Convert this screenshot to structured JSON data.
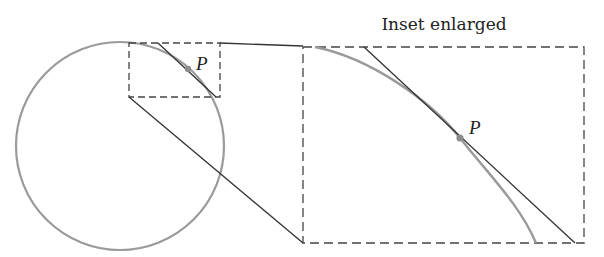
{
  "diagram": {
    "title": "Inset enlarged",
    "point_label_small": "P",
    "point_label_large": "P",
    "colors": {
      "curve": "#9a9a9a",
      "line": "#333333",
      "dash": "#444444",
      "point": "#8c8c8c"
    },
    "elements": [
      "circle",
      "small-inset-box",
      "tangent-line-at-P",
      "point-P",
      "enlarged-inset-box",
      "connector-lines",
      "enlarged-arc",
      "enlarged-tangent-line"
    ]
  }
}
